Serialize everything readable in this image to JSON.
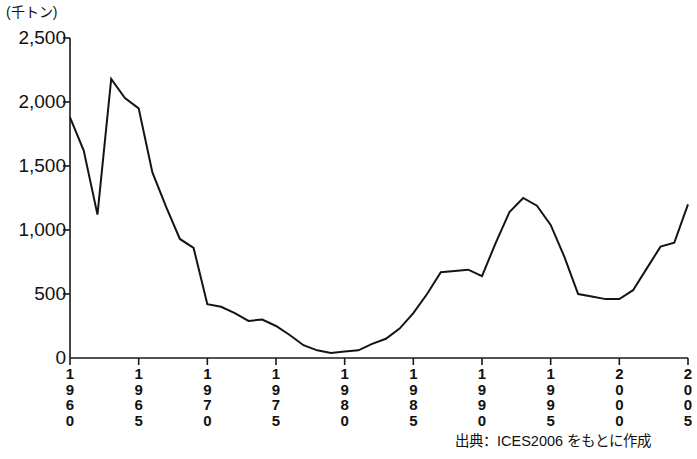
{
  "figure": {
    "unit_caption": "(千トン)",
    "source_note": "出典：ICES2006 をもとに作成"
  },
  "axes": {
    "y_ticks": [
      "0",
      "500",
      "1,000",
      "1,500",
      "2,000",
      "2,500"
    ],
    "x_ticks": [
      "1960",
      "1965",
      "1970",
      "1975",
      "1980",
      "1985",
      "1990",
      "1995",
      "2000",
      "2005"
    ]
  },
  "chart_data": {
    "type": "line",
    "title": "",
    "subtitle": "",
    "xlabel": "",
    "ylabel": "(千トン)",
    "xlim": [
      1960,
      2005
    ],
    "ylim": [
      0,
      2500
    ],
    "ytick_values": [
      0,
      500,
      1000,
      1500,
      2000,
      2500
    ],
    "xtick_values": [
      1960,
      1965,
      1970,
      1975,
      1980,
      1985,
      1990,
      1995,
      2000,
      2005
    ],
    "grid": false,
    "legend": "none",
    "line_color": "#141414",
    "line_width": 2,
    "annotations": [
      "出典：ICES2006 をもとに作成"
    ],
    "x": [
      1960,
      1961,
      1962,
      1963,
      1964,
      1965,
      1966,
      1967,
      1968,
      1969,
      1970,
      1971,
      1972,
      1973,
      1974,
      1975,
      1976,
      1977,
      1978,
      1979,
      1980,
      1981,
      1982,
      1983,
      1984,
      1985,
      1986,
      1987,
      1988,
      1989,
      1990,
      1991,
      1992,
      1993,
      1994,
      1995,
      1996,
      1997,
      1998,
      1999,
      2000,
      2001,
      2002,
      2003,
      2004,
      2005
    ],
    "y": [
      1880,
      1620,
      1120,
      2180,
      2030,
      1950,
      1450,
      1180,
      930,
      860,
      420,
      400,
      350,
      290,
      300,
      250,
      180,
      100,
      60,
      40,
      50,
      60,
      110,
      150,
      230,
      350,
      500,
      670,
      680,
      690,
      640,
      900,
      1140,
      1250,
      1190,
      1040,
      790,
      500,
      480,
      460,
      460,
      530,
      700,
      870,
      900,
      1200
    ],
    "series": [
      {
        "name": "漁獲量",
        "values": [
          1880,
          1620,
          1120,
          2180,
          2030,
          1950,
          1450,
          1180,
          930,
          860,
          420,
          400,
          350,
          290,
          300,
          250,
          180,
          100,
          60,
          40,
          50,
          60,
          110,
          150,
          230,
          350,
          500,
          670,
          680,
          690,
          640,
          900,
          1140,
          1250,
          1190,
          1040,
          790,
          500,
          480,
          460,
          460,
          530,
          700,
          870,
          900,
          1200
        ]
      }
    ]
  },
  "curve_points": [
    {
      "year": 1960,
      "value": 1880
    },
    {
      "year": 1961,
      "value": 1620
    },
    {
      "year": 1962,
      "value": 1120
    },
    {
      "year": 1963,
      "value": 2180
    },
    {
      "year": 1964,
      "value": 2030
    },
    {
      "year": 1965,
      "value": 1950
    },
    {
      "year": 1966,
      "value": 1450
    },
    {
      "year": 1967,
      "value": 1180
    },
    {
      "year": 1968,
      "value": 930
    },
    {
      "year": 1969,
      "value": 860
    },
    {
      "year": 1970,
      "value": 420
    },
    {
      "year": 1971,
      "value": 400
    },
    {
      "year": 1972,
      "value": 350
    },
    {
      "year": 1973,
      "value": 290
    },
    {
      "year": 1974,
      "value": 300
    },
    {
      "year": 1975,
      "value": 250
    },
    {
      "year": 1976,
      "value": 180
    },
    {
      "year": 1977,
      "value": 100
    },
    {
      "year": 1978,
      "value": 60
    },
    {
      "year": 1979,
      "value": 40
    },
    {
      "year": 1980,
      "value": 50
    },
    {
      "year": 1981,
      "value": 60
    },
    {
      "year": 1982,
      "value": 110
    },
    {
      "year": 1983,
      "value": 150
    },
    {
      "year": 1984,
      "value": 230
    },
    {
      "year": 1985,
      "value": 350
    },
    {
      "year": 1986,
      "value": 500
    },
    {
      "year": 1987,
      "value": 670
    },
    {
      "year": 1988,
      "value": 680
    },
    {
      "year": 1989,
      "value": 690
    },
    {
      "year": 1990,
      "value": 640
    },
    {
      "year": 1991,
      "value": 900
    },
    {
      "year": 1992,
      "value": 1140
    },
    {
      "year": 1993,
      "value": 1250
    },
    {
      "year": 1994,
      "value": 1190
    },
    {
      "year": 1995,
      "value": 1040
    },
    {
      "year": 1996,
      "value": 790
    },
    {
      "year": 1997,
      "value": 500
    },
    {
      "year": 1998,
      "value": 480
    },
    {
      "year": 1999,
      "value": 460
    },
    {
      "year": 2000,
      "value": 460
    },
    {
      "year": 2001,
      "value": 530
    },
    {
      "year": 2002,
      "value": 700
    },
    {
      "year": 2003,
      "value": 870
    },
    {
      "year": 2004,
      "value": 900
    },
    {
      "year": 2005,
      "value": 1200
    }
  ]
}
